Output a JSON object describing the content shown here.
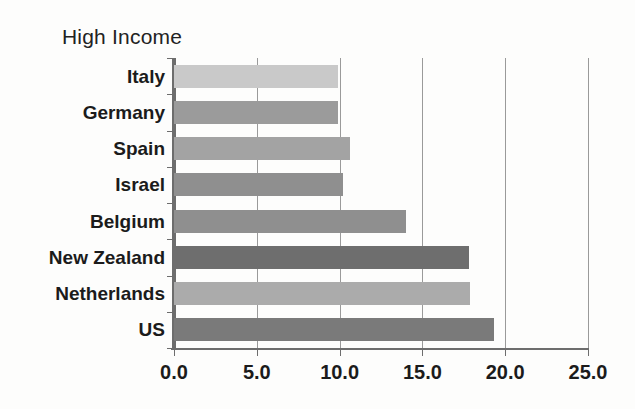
{
  "chart_data": {
    "type": "bar",
    "orientation": "horizontal",
    "title": "High Income",
    "xlabel": "",
    "ylabel": "",
    "xlim": [
      0.0,
      25.0
    ],
    "xticks": [
      "0.0",
      "5.0",
      "10.0",
      "15.0",
      "20.0",
      "25.0"
    ],
    "xtick_values": [
      0,
      5,
      10,
      15,
      20,
      25
    ],
    "grid": true,
    "grid_axis": "x",
    "legend": false,
    "categories": [
      "Italy",
      "Germany",
      "Spain",
      "Israel",
      "Belgium",
      "New Zealand",
      "Netherlands",
      "US"
    ],
    "values": [
      9.9,
      9.9,
      10.6,
      10.2,
      14.0,
      17.8,
      17.9,
      19.3
    ],
    "bar_colors": [
      "#c9c9c9",
      "#9b9b9b",
      "#a3a3a3",
      "#8f8f8f",
      "#8f8f8f",
      "#6e6e6e",
      "#ababab",
      "#7a7a7a"
    ],
    "bars": [
      {
        "label": "Italy",
        "value": 9.9,
        "color": "#c9c9c9"
      },
      {
        "label": "Germany",
        "value": 9.9,
        "color": "#9b9b9b"
      },
      {
        "label": "Spain",
        "value": 10.6,
        "color": "#a3a3a3"
      },
      {
        "label": "Israel",
        "value": 10.2,
        "color": "#8f8f8f"
      },
      {
        "label": "Belgium",
        "value": 14.0,
        "color": "#8f8f8f"
      },
      {
        "label": "New Zealand",
        "value": 17.8,
        "color": "#6e6e6e"
      },
      {
        "label": "Netherlands",
        "value": 17.9,
        "color": "#ababab"
      },
      {
        "label": "US",
        "value": 19.3,
        "color": "#7a7a7a"
      }
    ]
  },
  "colors": {
    "background": "#fdfdfc",
    "axis": "#6d6d6d",
    "grid": "#9a9a9a",
    "text": "#1b1b1b"
  }
}
